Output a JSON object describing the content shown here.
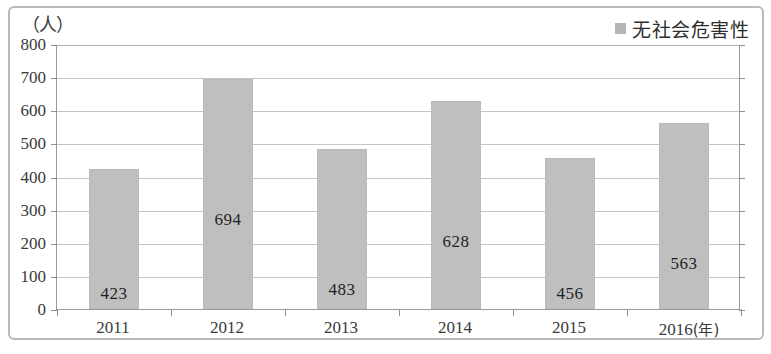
{
  "chart_data": {
    "type": "bar",
    "title": "",
    "subtitle": "",
    "categories": [
      "2011",
      "2012",
      "2013",
      "2014",
      "2015",
      "2016"
    ],
    "values": [
      423,
      694,
      483,
      628,
      456,
      563
    ],
    "series": [
      {
        "name": "无社会危害性",
        "values": [
          423,
          694,
          483,
          628,
          456,
          563
        ]
      }
    ],
    "xlabel": "(年)",
    "ylabel": "（人）",
    "ylim": [
      0,
      800
    ],
    "y_ticks": [
      "800",
      "700",
      "600",
      "500",
      "400",
      "300",
      "200",
      "100",
      "0"
    ],
    "y_tick_values": [
      800,
      700,
      600,
      500,
      400,
      300,
      200,
      100,
      0
    ],
    "grid": true,
    "legend_position": "top-right",
    "bar_color": "#bfbfbf",
    "gridline_color": "#c5c5c5",
    "axis_color": "#9a9a9a"
  },
  "legend": {
    "entries": [
      {
        "label": "无社会危害性",
        "color": "#b6b6b6"
      }
    ]
  },
  "axes": {
    "y_unit_label": "（人）",
    "x_unit_label": "(年)"
  },
  "data_labels": [
    "423",
    "694",
    "483",
    "628",
    "456",
    "563"
  ]
}
